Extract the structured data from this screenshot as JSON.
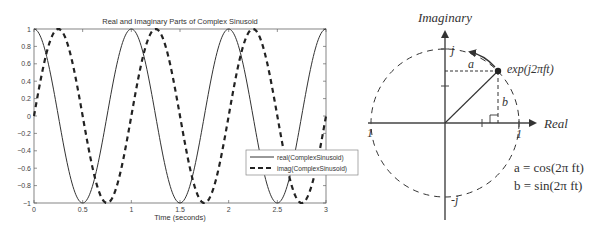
{
  "chart_data": {
    "type": "line",
    "title": "Real and Imaginary Parts of Complex Sinusoid",
    "xlabel": "Time (seconds)",
    "ylabel": "",
    "xlim": [
      0,
      3
    ],
    "ylim": [
      -1,
      1
    ],
    "x_ticks": [
      "0",
      "0.5",
      "1",
      "1.5",
      "2",
      "2.5",
      "3"
    ],
    "y_ticks": [
      "1",
      "0.8",
      "0.6",
      "0.4",
      "0.2",
      "0",
      "-0.2",
      "-0.4",
      "-0.6",
      "-0.8",
      "-1"
    ],
    "grid": false,
    "legend_position": "right-middle",
    "frequency_hz": 1,
    "series": [
      {
        "name": "real(ComplexSinusoid)",
        "style": "solid",
        "function": "cos(2*pi*t)",
        "x": [
          0,
          0.25,
          0.5,
          0.75,
          1,
          1.25,
          1.5,
          1.75,
          2,
          2.25,
          2.5,
          2.75,
          3
        ],
        "values": [
          1,
          0,
          -1,
          0,
          1,
          0,
          -1,
          0,
          1,
          0,
          -1,
          0,
          1
        ]
      },
      {
        "name": "imag(ComplexSinusoid)",
        "style": "dashed",
        "function": "sin(2*pi*t)",
        "x": [
          0,
          0.25,
          0.5,
          0.75,
          1,
          1.25,
          1.5,
          1.75,
          2,
          2.25,
          2.5,
          2.75,
          3
        ],
        "values": [
          0,
          1,
          0,
          -1,
          0,
          1,
          0,
          -1,
          0,
          1,
          0,
          -1,
          0
        ]
      }
    ]
  },
  "diagram": {
    "imag_axis_label": "Imaginary",
    "real_axis_label": "Real",
    "point_label": "exp(j2πft)",
    "label_j": "j",
    "label_neg_j": "-j",
    "label_one": "1",
    "label_neg_one": "1",
    "label_a": "a",
    "label_b": "b",
    "eq_a": "a = cos(2π ft)",
    "eq_b": "b = sin(2π ft)"
  },
  "colors": {
    "line": "#222222",
    "axis": "#444444",
    "text": "#333333"
  }
}
